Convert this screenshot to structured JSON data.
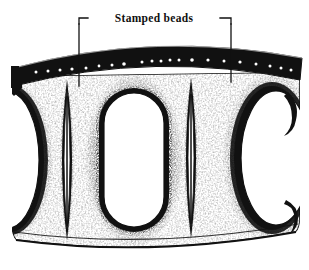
{
  "figure": {
    "kind": "line-art-illustration",
    "background_color": "#ffffff",
    "ink_color": "#111111",
    "width": 309,
    "height": 270
  },
  "annotation": {
    "label": "Stamped beads",
    "label_x": 154,
    "label_y": 22,
    "leader_left": {
      "name": "leader-line-left",
      "points": "78,24 78,18 88,18"
    },
    "leader_left_stem": {
      "name": "leader-stem-left",
      "points": "78,24 78,84"
    },
    "leader_right": {
      "name": "leader-line-right",
      "points": "220,18 231,18 231,24"
    },
    "leader_right_stem": {
      "name": "leader-stem-right",
      "points": "231,24 231,80"
    }
  },
  "band": {
    "name": "stamped-bead-band",
    "description": "Dark arched strip across the top carrying punched bead dots",
    "fill": "#111111",
    "bead_color": "#ffffff",
    "bead_count": 21,
    "beads": [
      {
        "x": 36,
        "y": 72,
        "r": 1.5
      },
      {
        "x": 48,
        "y": 71,
        "r": 1.5
      },
      {
        "x": 60,
        "y": 70,
        "r": 1.5
      },
      {
        "x": 72,
        "y": 69,
        "r": 1.6
      },
      {
        "x": 86,
        "y": 68,
        "r": 1.5
      },
      {
        "x": 99,
        "y": 66,
        "r": 1.4
      },
      {
        "x": 112,
        "y": 65,
        "r": 1.5
      },
      {
        "x": 124,
        "y": 64,
        "r": 1.8
      },
      {
        "x": 142,
        "y": 62,
        "r": 1.5
      },
      {
        "x": 152,
        "y": 61,
        "r": 1.5
      },
      {
        "x": 161,
        "y": 61,
        "r": 1.5
      },
      {
        "x": 170,
        "y": 60,
        "r": 1.5
      },
      {
        "x": 179,
        "y": 60,
        "r": 1.5
      },
      {
        "x": 192,
        "y": 60,
        "r": 1.8
      },
      {
        "x": 208,
        "y": 60,
        "r": 1.6
      },
      {
        "x": 224,
        "y": 61,
        "r": 1.5
      },
      {
        "x": 240,
        "y": 62,
        "r": 1.6
      },
      {
        "x": 256,
        "y": 64,
        "r": 1.5
      },
      {
        "x": 270,
        "y": 66,
        "r": 1.5
      },
      {
        "x": 281,
        "y": 68,
        "r": 1.5
      },
      {
        "x": 291,
        "y": 70,
        "r": 1.5
      }
    ]
  },
  "body": {
    "name": "band-body",
    "description": "Shaded sheet metal body with openwork cutouts and stippled shading"
  },
  "openings": [
    {
      "name": "oval-opening-left-partial",
      "cx": 10,
      "cy": 160,
      "rx": 34,
      "ry": 72
    },
    {
      "name": "oval-opening-center",
      "cx": 134,
      "cy": 160,
      "rx": 36,
      "ry": 74
    },
    {
      "name": "oval-opening-right-partial",
      "cx": 268,
      "cy": 158,
      "rx": 36,
      "ry": 72
    }
  ],
  "ribs": [
    {
      "name": "lens-rib-left",
      "cx": 67,
      "cy": 160,
      "half_width": 9,
      "top": 80,
      "bottom": 240
    },
    {
      "name": "lens-rib-right",
      "cx": 191,
      "cy": 157,
      "half_width": 9,
      "top": 78,
      "bottom": 238
    }
  ],
  "rim": {
    "name": "bottom-rim",
    "description": "Curved lower edge line of the band"
  },
  "end_tabs": [
    {
      "name": "left-end-tab",
      "x": 12,
      "y": 78
    },
    {
      "name": "right-end-hook",
      "x": 286,
      "y": 96
    }
  ]
}
